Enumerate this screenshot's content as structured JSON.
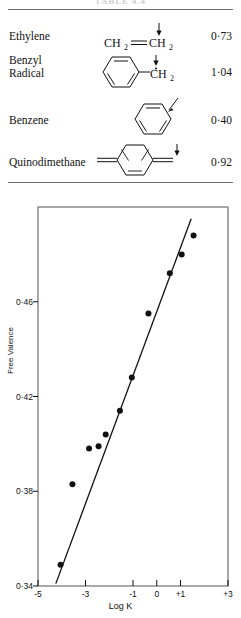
{
  "table": {
    "caption": "TABLE 4.4",
    "columns": [
      "Compound",
      "Structure",
      "Free valence"
    ],
    "rows": [
      {
        "name": "Ethylene",
        "structure": "CH2=CH2",
        "structure_kind": "ethylene",
        "arrow": "down-arrow",
        "value": "0·73"
      },
      {
        "name": "Benzyl\nRadical",
        "structure": "C6H5-CH2 radical",
        "structure_kind": "benzyl-radical",
        "arrow": "down-arrow",
        "value": "1·04"
      },
      {
        "name": "Benzene",
        "structure": "C6H6 ring",
        "structure_kind": "benzene",
        "arrow": "diagonal-arrow",
        "value": "0·40"
      },
      {
        "name": "Quinodimethane",
        "structure": "para-quinodimethane",
        "structure_kind": "quinodimethane",
        "arrow": "down-arrow",
        "value": "0·92"
      }
    ]
  },
  "chart_data": {
    "type": "scatter",
    "title": "",
    "xlabel": "Log K",
    "ylabel": "Free Valence",
    "xlim": [
      -5,
      3
    ],
    "ylim": [
      0.34,
      0.5
    ],
    "grid": false,
    "legend": "none",
    "xticks": [
      "-5",
      "-3",
      "-1",
      "0",
      "+1",
      "+3"
    ],
    "xtick_values": [
      -5,
      -3,
      -1,
      0,
      1,
      3
    ],
    "yticks": [
      "0·34",
      "0·38",
      "0·42",
      "0·46"
    ],
    "ytick_values": [
      0.34,
      0.38,
      0.42,
      0.46
    ],
    "points": [
      {
        "x": -4.05,
        "y": 0.349
      },
      {
        "x": -3.55,
        "y": 0.383
      },
      {
        "x": -2.85,
        "y": 0.398
      },
      {
        "x": -2.45,
        "y": 0.399
      },
      {
        "x": -2.15,
        "y": 0.404
      },
      {
        "x": -1.55,
        "y": 0.414
      },
      {
        "x": -1.05,
        "y": 0.428
      },
      {
        "x": -0.35,
        "y": 0.455
      },
      {
        "x": 0.55,
        "y": 0.472
      },
      {
        "x": 1.05,
        "y": 0.48
      },
      {
        "x": 1.55,
        "y": 0.488
      }
    ],
    "fit_line": {
      "x1": -4.25,
      "y1": 0.341,
      "x2": 1.45,
      "y2": 0.495
    }
  }
}
